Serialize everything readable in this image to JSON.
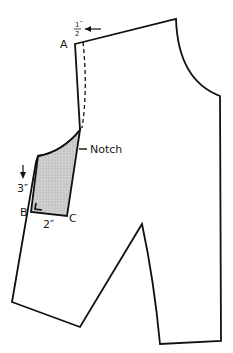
{
  "diagram": {
    "labels": {
      "point_a": "A",
      "point_b": "B",
      "point_c": "C",
      "notch": "Notch",
      "half_inch_num": "1",
      "half_inch_den": "2",
      "inch_mark": "″",
      "three_inch": "3″",
      "two_inch": "2″"
    },
    "colors": {
      "line": "#111111",
      "shade": "#c8c8c8"
    }
  }
}
